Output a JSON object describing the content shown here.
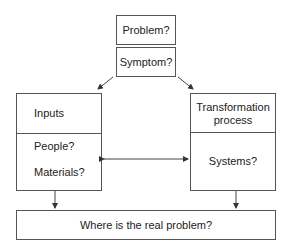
{
  "diagram": {
    "problem_box": {
      "label": "Problem?"
    },
    "symptom_box": {
      "label": "Symptom?"
    },
    "inputs_box": {
      "title": "Inputs",
      "items": [
        "People?",
        "Materials?"
      ]
    },
    "transformation_box": {
      "title_line1": "Transformation",
      "title_line2": "process",
      "items": [
        "Systems?"
      ]
    },
    "result_box": {
      "label": "Where is the real problem?"
    },
    "connectors": [
      {
        "from": "Symptom?",
        "to": "Inputs",
        "type": "arrow"
      },
      {
        "from": "Symptom?",
        "to": "Transformation process",
        "type": "arrow"
      },
      {
        "from": "Inputs",
        "to": "Transformation process",
        "type": "double-arrow"
      },
      {
        "from": "Inputs",
        "to": "Where is the real problem?",
        "type": "arrow"
      },
      {
        "from": "Transformation process",
        "to": "Where is the real problem?",
        "type": "arrow"
      }
    ],
    "colors": {
      "line": "#555555",
      "text": "#222222",
      "background": "#ffffff"
    }
  }
}
